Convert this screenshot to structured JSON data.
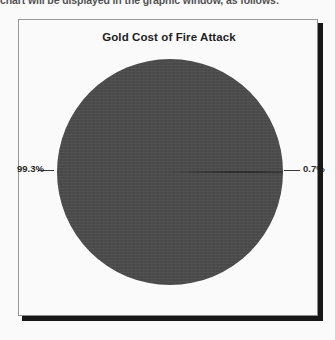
{
  "document": {
    "intro_text": "chart will be displayed in the graphic window, as follows:"
  },
  "chart_panel": {
    "title": "Gold Cost of Fire Attack",
    "label_left": "99.3%",
    "label_right": "0.7%"
  },
  "colors": {
    "pie_slice_major": "#4a4a4a",
    "pie_slice_minor": "#1d1d1d",
    "panel_background": "#ffffff",
    "panel_border": "#9a9a9a",
    "panel_shadow": "#141414",
    "text": "#1c1c1c"
  },
  "chart_data": {
    "type": "pie",
    "title": "Gold Cost of Fire Attack",
    "categories": [
      "99.3%",
      "0.7%"
    ],
    "values": [
      99.3,
      0.7
    ],
    "labels": [
      "99.3%",
      "0.7%"
    ],
    "colors": [
      "#4a4a4a",
      "#1d1d1d"
    ],
    "start_angle": 0,
    "direction": "counterclockwise",
    "legend": "none",
    "grid": false,
    "xlabel": "",
    "ylabel": ""
  }
}
